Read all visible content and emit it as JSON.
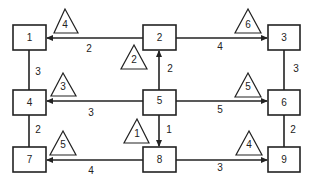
{
  "diagram": {
    "type": "network",
    "nodes": [
      {
        "id": "1",
        "label": "1",
        "x": 13,
        "y": 25
      },
      {
        "id": "2",
        "label": "2",
        "x": 143,
        "y": 25
      },
      {
        "id": "3",
        "label": "3",
        "x": 268,
        "y": 25
      },
      {
        "id": "4",
        "label": "4",
        "x": 13,
        "y": 90
      },
      {
        "id": "5",
        "label": "5",
        "x": 143,
        "y": 90
      },
      {
        "id": "6",
        "label": "6",
        "x": 268,
        "y": 90
      },
      {
        "id": "7",
        "label": "7",
        "x": 13,
        "y": 147
      },
      {
        "id": "8",
        "label": "8",
        "x": 143,
        "y": 147
      },
      {
        "id": "9",
        "label": "9",
        "x": 268,
        "y": 147
      }
    ],
    "edges": [
      {
        "from": "2",
        "to": "1",
        "directed": true,
        "weight": "2",
        "triangle": "4"
      },
      {
        "from": "2",
        "to": "3",
        "directed": true,
        "weight": "4",
        "triangle": "6"
      },
      {
        "from": "1",
        "to": "4",
        "directed": false,
        "weight": "3"
      },
      {
        "from": "3",
        "to": "6",
        "directed": false,
        "weight": "3"
      },
      {
        "from": "5",
        "to": "2",
        "directed": true,
        "weight": "2",
        "triangle": "2"
      },
      {
        "from": "5",
        "to": "4",
        "directed": true,
        "weight": "3",
        "triangle": "3"
      },
      {
        "from": "5",
        "to": "6",
        "directed": true,
        "weight": "5",
        "triangle": "5"
      },
      {
        "from": "5",
        "to": "8",
        "directed": true,
        "weight": "1",
        "triangle": "1"
      },
      {
        "from": "4",
        "to": "7",
        "directed": false,
        "weight": "2"
      },
      {
        "from": "6",
        "to": "9",
        "directed": false,
        "weight": "2"
      },
      {
        "from": "8",
        "to": "7",
        "directed": true,
        "weight": "4",
        "triangle": "5"
      },
      {
        "from": "8",
        "to": "9",
        "directed": true,
        "weight": "3",
        "triangle": "4"
      }
    ]
  },
  "labels": {
    "n1": "1",
    "n2": "2",
    "n3": "3",
    "n4": "4",
    "n5": "5",
    "n6": "6",
    "n7": "7",
    "n8": "8",
    "n9": "9",
    "w_2_1": "2",
    "w_2_3": "4",
    "w_1_4": "3",
    "w_3_6": "3",
    "w_5_2": "2",
    "w_5_4": "3",
    "w_5_6": "5",
    "w_5_8": "1",
    "w_4_7": "2",
    "w_6_9": "2",
    "w_8_7": "4",
    "w_8_9": "3",
    "t_2_1": "4",
    "t_2_3": "6",
    "t_5_2": "2",
    "t_5_4": "3",
    "t_5_6": "5",
    "t_5_8": "1",
    "t_8_7": "5",
    "t_8_9": "4"
  }
}
